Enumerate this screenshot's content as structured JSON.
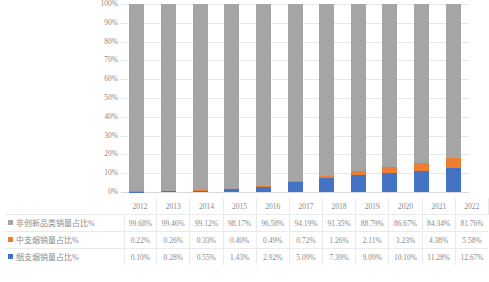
{
  "chart_data": {
    "type": "bar",
    "stacked": true,
    "stacked_percent": true,
    "title": "",
    "subtitle": "",
    "xlabel": "",
    "ylabel": "",
    "ylim": [
      0,
      100
    ],
    "grid": true,
    "legend_position": "table-left",
    "categories": [
      "2012",
      "2013",
      "2014",
      "2015",
      "2016",
      "2017",
      "2018",
      "2019",
      "2020",
      "2021",
      "2022"
    ],
    "y_ticks": [
      "0%",
      "10%",
      "20%",
      "30%",
      "40%",
      "50%",
      "60%",
      "70%",
      "80%",
      "90%",
      "100%"
    ],
    "series": [
      {
        "name": "非创新品类销量占比%",
        "color": "#a5a5a5",
        "stack_order": 3,
        "values": [
          99.68,
          99.46,
          99.12,
          98.17,
          96.58,
          94.19,
          91.35,
          88.79,
          86.67,
          84.34,
          81.76
        ],
        "labels": [
          "99.68%",
          "99.46%",
          "99.12%",
          "98.17%",
          "96.58%",
          "94.19%",
          "91.35%",
          "88.79%",
          "86.67%",
          "84.34%",
          "81.76%"
        ]
      },
      {
        "name": "中支烟销量占比%",
        "color": "#ed7d31",
        "stack_order": 2,
        "values": [
          0.22,
          0.26,
          0.33,
          0.4,
          0.49,
          0.72,
          1.26,
          2.11,
          3.23,
          4.38,
          5.58
        ],
        "labels": [
          "0.22%",
          "0.26%",
          "0.33%",
          "0.40%",
          "0.49%",
          "0.72%",
          "1.26%",
          "2.11%",
          "3.23%",
          "4.38%",
          "5.58%"
        ]
      },
      {
        "name": "细支烟销量占比%",
        "color": "#4472c4",
        "stack_order": 1,
        "values": [
          0.1,
          0.28,
          0.55,
          1.43,
          2.92,
          5.09,
          7.39,
          9.09,
          10.1,
          11.28,
          12.67
        ],
        "labels": [
          "0.10%",
          "0.28%",
          "0.55%",
          "1.43%",
          "2.92%",
          "5.09%",
          "7.39%",
          "9.09%",
          "10.10%",
          "11.28%",
          "12.67%"
        ]
      }
    ]
  }
}
